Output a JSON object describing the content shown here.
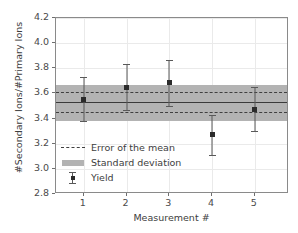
{
  "chart_data": {
    "type": "scatter",
    "title": "",
    "xlabel": "Measurement #",
    "ylabel": "#Secondary Ions/#Primary Ions",
    "xlim": [
      0.35,
      5.8
    ],
    "ylim": [
      2.8,
      4.2
    ],
    "xticks": [
      1,
      2,
      3,
      4,
      5
    ],
    "xtick_labels": [
      "1",
      "2",
      "3",
      "4",
      "5"
    ],
    "yticks": [
      2.8,
      3.0,
      3.2,
      3.4,
      3.6,
      3.8,
      4.0,
      4.2
    ],
    "ytick_labels": [
      "2.8",
      "3.0",
      "3.2",
      "3.4",
      "3.6",
      "3.8",
      "4.0",
      "4.2"
    ],
    "grid": true,
    "legend_position": "lower left",
    "series": [
      {
        "name": "Yield",
        "type": "errorbar",
        "x": [
          1,
          2,
          3,
          4,
          5
        ],
        "values": [
          3.555,
          3.65,
          3.685,
          3.27,
          3.475
        ],
        "yerr": [
          0.175,
          0.185,
          0.185,
          0.16,
          0.175
        ],
        "marker_color": "#2b2b2b",
        "line_color": "#595959"
      }
    ],
    "mean_line": {
      "name": "Mean",
      "value": 3.53,
      "color": "#3a3a3a"
    },
    "error_of_the_mean": {
      "name": "Error of the mean",
      "upper": 3.61,
      "lower": 3.455,
      "color": "#3f3f3f",
      "style": "dashed"
    },
    "standard_deviation": {
      "name": "Standard deviation",
      "upper": 3.665,
      "lower": 3.38,
      "color": "#b3b3b3"
    }
  },
  "legend": {
    "items": [
      {
        "label": "Error of the mean",
        "key": "dashed-line-key"
      },
      {
        "label": "Standard deviation",
        "key": "band-key"
      },
      {
        "label": "Yield",
        "key": "errorbar-marker-key"
      }
    ]
  },
  "colors": {
    "band": "#b3b3b3",
    "mean": "#3a3a3a",
    "marker": "#2b2b2b",
    "grid": "#eaeaea",
    "axis": "#8a8a8a",
    "text": "#3d3d3d"
  }
}
